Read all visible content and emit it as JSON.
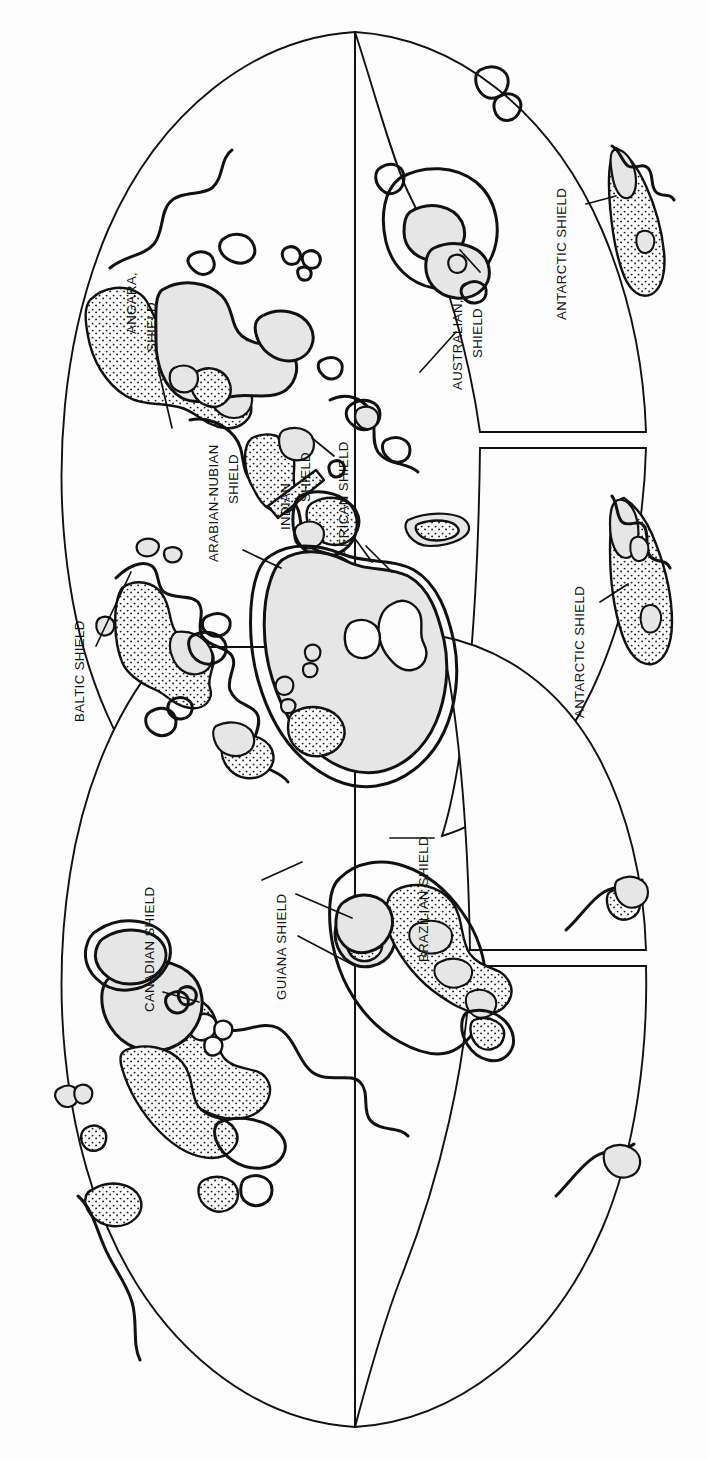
{
  "document": {
    "kind": "map-figure",
    "title": "World map of Precambrian shields",
    "projection": "interrupted sinusoidal / Goode-style homolosine, rotated 90 degrees",
    "orientation_note": "Figure is rotated 90 degrees clockwise; all labels read bottom-to-top.",
    "background_color": "#fdfdfd",
    "line_color": "#111111",
    "platform_fill_color": "#e6e6e6",
    "shield_fill_pattern": "stipple-dots",
    "shield_fill_color": "#fdfdfd"
  },
  "legend_keys": [
    {
      "name": "shield",
      "label": "Shield (stippled)",
      "pattern": "stipple-dots"
    },
    {
      "name": "platform",
      "label": "Platform / craton cover (light gray)",
      "color": "#e6e6e6"
    },
    {
      "name": "coastline",
      "label": "Coastline (heavy black outline)",
      "color": "#111111"
    }
  ],
  "labels": [
    {
      "id": "baltic",
      "text": "BALTIC SHIELD",
      "lines": [
        "BALTIC SHIELD"
      ],
      "x": 78,
      "y": 718,
      "leader": "M 96,646 L 131,572"
    },
    {
      "id": "angara",
      "text": "ANGARA, SHIELD",
      "lines": [
        "ANGARA,",
        "SHIELD"
      ],
      "x": 140,
      "y": 300,
      "leader": "M 158,368 L 168,420"
    },
    {
      "id": "canadian",
      "text": "CANADIAN SHIELD",
      "lines": [
        "CANADIAN SHIELD"
      ],
      "x": 148,
      "y": 918,
      "leader": "M 163,992 L 196,1000"
    },
    {
      "id": "arabian_nubian",
      "text": "ARABIAN-NUBIAN SHIELD",
      "lines": [
        "ARABIAN-NUBIAN",
        "SHIELD"
      ],
      "x": 222,
      "y": 500,
      "leader": "M 243,550 L 278,566"
    },
    {
      "id": "indian",
      "text": "INDIAN SHIELD",
      "lines": [
        "INDIAN",
        "SHIELD"
      ],
      "x": 296,
      "y": 484,
      "leader": "M 310,440 L 330,452"
    },
    {
      "id": "guiana",
      "text": "GUIANA SHIELD",
      "lines": [
        "GUIANA SHIELD"
      ],
      "x": 280,
      "y": 905,
      "leader": "M 298,938 L 352,968"
    },
    {
      "id": "african",
      "text": "AFRICAN SHIELD",
      "lines": [
        "AFRICAN SHIELD"
      ],
      "x": 352,
      "y": 497,
      "leader": "M 366,548 L 390,570"
    },
    {
      "id": "brazilian",
      "text": "BRAZILIAN SHIELD",
      "lines": [
        "BRAZILIAN SHIELD"
      ],
      "x": 422,
      "y": 875,
      "leader": "M 434,838 L 392,838"
    },
    {
      "id": "australian",
      "text": "AUSTRALIAN SHIELD",
      "lines": [
        "AUSTRALIAN,",
        "SHIELD"
      ],
      "x": 468,
      "y": 305,
      "leader": "M 478,268 L 462,253"
    },
    {
      "id": "antarctic_top",
      "text": "ANTARCTIC SHIELD",
      "lines": [
        "ANTARCTIC SHIELD"
      ],
      "x": 570,
      "y": 260,
      "leader": "M 586,206 L 620,196"
    },
    {
      "id": "antarctic_bot",
      "text": "ANTARCTIC SHIELD",
      "lines": [
        "ANTARCTIC SHIELD"
      ],
      "x": 588,
      "y": 634,
      "leader": "M 600,604 L 628,586"
    }
  ],
  "shield_regions": [
    "Baltic Shield",
    "Angara Shield",
    "Canadian Shield",
    "Arabian-Nubian Shield",
    "Indian Shield",
    "Guiana Shield",
    "African Shield",
    "Brazilian Shield",
    "Australian Shield",
    "Antarctic Shield"
  ],
  "lobes": [
    {
      "name": "north-america-lobe",
      "hemisphere": "western",
      "contains": [
        "Canadian Shield"
      ]
    },
    {
      "name": "south-america-lobe",
      "hemisphere": "western",
      "contains": [
        "Guiana Shield",
        "Brazilian Shield"
      ]
    },
    {
      "name": "eurasia-africa-lobe",
      "hemisphere": "eastern",
      "contains": [
        "Baltic Shield",
        "Angara Shield",
        "Arabian-Nubian Shield",
        "Indian Shield",
        "African Shield"
      ]
    },
    {
      "name": "australia-lobe",
      "hemisphere": "eastern",
      "contains": [
        "Australian Shield",
        "Antarctic Shield"
      ]
    },
    {
      "name": "antarctica-lobe",
      "hemisphere": "southern",
      "contains": [
        "Antarctic Shield"
      ]
    }
  ]
}
